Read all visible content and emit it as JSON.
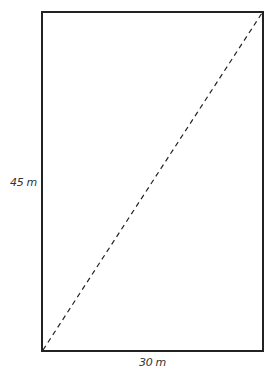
{
  "diagram": {
    "shape": "rectangle",
    "labels": {
      "height": "45 m",
      "width": "30 m"
    },
    "diagonal": "dashed",
    "colors": {
      "stroke": "#222222",
      "background": "#ffffff"
    }
  }
}
